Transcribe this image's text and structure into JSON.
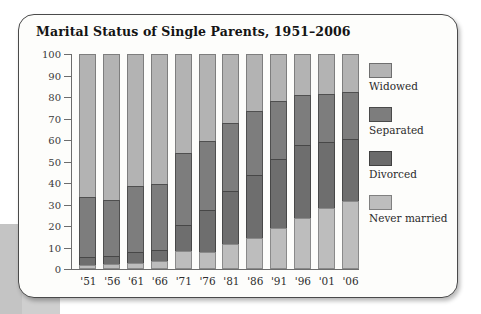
{
  "chart_data": {
    "type": "bar",
    "subtype": "stacked-100",
    "title": "Marital Status of Single Parents, 1951–2006",
    "xlabel": "",
    "ylabel": "Percentage",
    "ylim": [
      0,
      100
    ],
    "ytick_labels": [
      "100",
      "90",
      "80",
      "70",
      "60",
      "50",
      "40",
      "30",
      "20",
      "10",
      "0"
    ],
    "ytick_values": [
      100,
      90,
      80,
      70,
      60,
      50,
      40,
      30,
      20,
      10,
      0
    ],
    "grid": false,
    "legend_position": "right",
    "categories": [
      "'51",
      "'56",
      "'61",
      "'66",
      "'71",
      "'76",
      "'81",
      "'86",
      "'91",
      "'96",
      "'01",
      "'06"
    ],
    "category_years": [
      1951,
      1956,
      1961,
      1966,
      1971,
      1976,
      1981,
      1986,
      1991,
      1996,
      2001,
      2006
    ],
    "series": [
      {
        "name": "Never married",
        "color": "#bdbdbd",
        "values": [
          2,
          2.5,
          3,
          3.5,
          8.5,
          8,
          11.5,
          14.5,
          19,
          23.5,
          28.5,
          31.5
        ]
      },
      {
        "name": "Divorced",
        "color": "#6b6b6b",
        "values": [
          3.5,
          3.5,
          5,
          5.5,
          12,
          19.5,
          25,
          29,
          32,
          34,
          30.5,
          29
        ]
      },
      {
        "name": "Separated",
        "color": "#7d7d7d",
        "values": [
          28,
          26,
          30.5,
          30.5,
          33.5,
          32,
          31.5,
          30,
          27,
          23.5,
          22.5,
          22
        ]
      },
      {
        "name": "Widowed",
        "color": "#b3b3b3",
        "values": [
          66.5,
          68,
          61.5,
          60.5,
          46,
          40.5,
          32,
          26.5,
          22,
          19,
          18.5,
          17.5
        ]
      }
    ],
    "cumulative_boundaries": {
      "'51": [
        2,
        5.5,
        33.5,
        100
      ],
      "'56": [
        2.5,
        6,
        32,
        100
      ],
      "'61": [
        3,
        8,
        38.5,
        100
      ],
      "'66": [
        3.5,
        9,
        39.5,
        100
      ],
      "'71": [
        8.5,
        20.5,
        54,
        100
      ],
      "'76": [
        8,
        27.5,
        59.5,
        100
      ],
      "'81": [
        11.5,
        36.5,
        68,
        100
      ],
      "'86": [
        14.5,
        43.5,
        73.5,
        100
      ],
      "'91": [
        19,
        51,
        78,
        100
      ],
      "'96": [
        23.5,
        57.5,
        81,
        100
      ],
      "'01": [
        28.5,
        59,
        81,
        100
      ],
      "'06": [
        31.5,
        60.5,
        82.5,
        100
      ]
    }
  },
  "legend": {
    "items": [
      {
        "label": "Widowed",
        "swatch": "widowed"
      },
      {
        "label": "Separated",
        "swatch": "separated"
      },
      {
        "label": "Divorced",
        "swatch": "divorced"
      },
      {
        "label": "Never married",
        "swatch": "nevermarried"
      }
    ]
  }
}
